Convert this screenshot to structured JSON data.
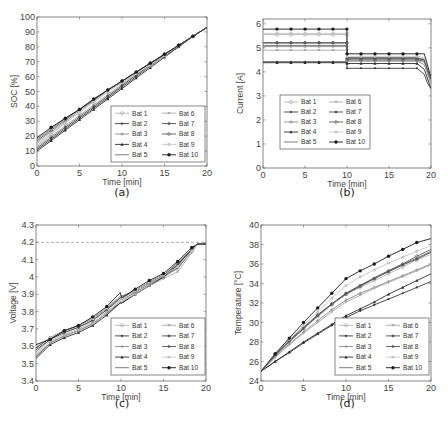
{
  "figure": {
    "panel_labels": [
      "(a)",
      "(b)",
      "(c)",
      "(d)"
    ],
    "legend_entries": [
      "Bat 1",
      "Bat 2",
      "Bat 3",
      "Bat 4",
      "Bat 5",
      "Bat 6",
      "Bat 7",
      "Bat 8",
      "Bat 9",
      "Bat 10"
    ],
    "series_style": [
      {
        "name": "Bat 1",
        "color": "#b5b5b5",
        "marker": "circle-open"
      },
      {
        "name": "Bat 2",
        "color": "#3a3a3a",
        "marker": "dot"
      },
      {
        "name": "Bat 3",
        "color": "#8a8a8a",
        "marker": "plus"
      },
      {
        "name": "Bat 4",
        "color": "#2e2e2e",
        "marker": "triangle"
      },
      {
        "name": "Bat 5",
        "color": "#6e6e6e",
        "marker": "none"
      },
      {
        "name": "Bat 6",
        "color": "#a8a8a8",
        "marker": "triangle-down"
      },
      {
        "name": "Bat 7",
        "color": "#4c4c4c",
        "marker": "star"
      },
      {
        "name": "Bat 8",
        "color": "#5a5a5a",
        "marker": "diamond"
      },
      {
        "name": "Bat 9",
        "color": "#c4c4c4",
        "marker": "square"
      },
      {
        "name": "Bat 10",
        "color": "#1a1a1a",
        "marker": "asterisk-dot"
      }
    ]
  },
  "chart_data": [
    {
      "panel": "(a)",
      "type": "line",
      "title": "",
      "xlabel": "Time [min]",
      "ylabel": "SOC [%]",
      "xlim": [
        0,
        20
      ],
      "ylim": [
        0,
        100
      ],
      "xticks": [
        0,
        5,
        10,
        15,
        20
      ],
      "yticks": [
        0,
        10,
        20,
        30,
        40,
        50,
        60,
        70,
        80,
        90,
        100
      ],
      "legend_position": "lower right",
      "x": [
        0,
        1.67,
        3.33,
        5,
        6.67,
        8.33,
        10,
        11.67,
        13.33,
        15,
        16.67,
        18.33,
        20
      ],
      "series": [
        {
          "name": "Bat 1",
          "values": [
            14,
            21,
            29,
            36,
            43,
            50,
            56,
            62,
            69,
            75,
            81,
            87,
            93
          ]
        },
        {
          "name": "Bat 2",
          "values": [
            11,
            18,
            25,
            32,
            39,
            46,
            53,
            60,
            67,
            74,
            80,
            87,
            93
          ]
        },
        {
          "name": "Bat 3",
          "values": [
            16,
            23,
            30,
            37,
            44,
            51,
            57,
            63,
            69,
            75,
            81,
            87,
            93
          ]
        },
        {
          "name": "Bat 4",
          "values": [
            10,
            17,
            24,
            31,
            38,
            45,
            52,
            59,
            66,
            73,
            80,
            87,
            93
          ]
        },
        {
          "name": "Bat 5",
          "values": [
            18,
            25,
            32,
            38,
            45,
            51,
            57,
            63,
            69,
            75,
            81,
            87,
            93
          ]
        },
        {
          "name": "Bat 6",
          "values": [
            13,
            20,
            27,
            34,
            41,
            48,
            55,
            61,
            67,
            74,
            80,
            87,
            93
          ]
        },
        {
          "name": "Bat 7",
          "values": [
            12,
            19,
            26,
            33,
            40,
            47,
            54,
            61,
            68,
            74,
            80,
            87,
            93
          ]
        },
        {
          "name": "Bat 8",
          "values": [
            17,
            24,
            31,
            38,
            44,
            51,
            57,
            63,
            69,
            75,
            81,
            87,
            93
          ]
        },
        {
          "name": "Bat 9",
          "values": [
            15,
            22,
            29,
            36,
            43,
            50,
            56,
            62,
            68,
            74,
            81,
            87,
            93
          ]
        },
        {
          "name": "Bat 10",
          "values": [
            19,
            26,
            32,
            38,
            45,
            51,
            57,
            63,
            69,
            75,
            81,
            87,
            93
          ]
        }
      ]
    },
    {
      "panel": "(b)",
      "type": "line",
      "title": "",
      "xlabel": "Time [min]",
      "ylabel": "Current [A]",
      "xlim": [
        0,
        20
      ],
      "ylim": [
        0,
        6.2
      ],
      "xticks": [
        0,
        5,
        10,
        15,
        20
      ],
      "yticks": [
        0,
        1,
        2,
        3,
        4,
        5,
        6
      ],
      "legend_position": "center left",
      "x": [
        0,
        1.67,
        3.33,
        5,
        6.67,
        8.33,
        9.99,
        10.01,
        11.67,
        13.33,
        15,
        16.67,
        18.33,
        19.2,
        19.5,
        19.8,
        20
      ],
      "series": [
        {
          "name": "Bat 1",
          "values": [
            5.55,
            5.55,
            5.55,
            5.55,
            5.55,
            5.55,
            5.55,
            4.55,
            4.55,
            4.55,
            4.55,
            4.55,
            4.55,
            4.55,
            4.1,
            3.7,
            3.5
          ]
        },
        {
          "name": "Bat 2",
          "values": [
            4.42,
            4.42,
            4.42,
            4.42,
            4.42,
            4.42,
            4.42,
            4.15,
            4.15,
            4.15,
            4.15,
            4.15,
            4.15,
            3.9,
            3.6,
            3.4,
            3.3
          ]
        },
        {
          "name": "Bat 3",
          "values": [
            5.05,
            5.05,
            5.05,
            5.05,
            5.05,
            5.05,
            5.05,
            4.45,
            4.45,
            4.45,
            4.45,
            4.45,
            4.45,
            4.3,
            4.0,
            3.7,
            3.5
          ]
        },
        {
          "name": "Bat 4",
          "values": [
            4.38,
            4.38,
            4.38,
            4.38,
            4.38,
            4.38,
            4.38,
            4.35,
            4.35,
            4.35,
            4.35,
            4.35,
            4.35,
            4.1,
            3.8,
            3.5,
            3.3
          ]
        },
        {
          "name": "Bat 5",
          "values": [
            5.1,
            5.1,
            5.1,
            5.1,
            5.1,
            5.1,
            5.1,
            4.6,
            4.6,
            4.6,
            4.6,
            4.6,
            4.6,
            4.5,
            4.2,
            3.9,
            3.6
          ]
        },
        {
          "name": "Bat 6",
          "values": [
            4.9,
            4.9,
            4.9,
            4.9,
            4.9,
            4.9,
            4.9,
            4.45,
            4.45,
            4.45,
            4.45,
            4.45,
            4.45,
            4.4,
            4.1,
            3.8,
            3.6
          ]
        },
        {
          "name": "Bat 7",
          "values": [
            5.2,
            5.2,
            5.2,
            5.2,
            5.2,
            5.2,
            5.2,
            4.55,
            4.55,
            4.55,
            4.55,
            4.55,
            4.55,
            4.5,
            4.2,
            3.9,
            3.7
          ]
        },
        {
          "name": "Bat 8",
          "values": [
            5.22,
            5.22,
            5.22,
            5.22,
            5.22,
            5.22,
            5.22,
            4.5,
            4.5,
            4.5,
            4.5,
            4.5,
            4.5,
            4.45,
            4.15,
            3.85,
            3.7
          ]
        },
        {
          "name": "Bat 9",
          "values": [
            5.6,
            5.6,
            5.6,
            5.6,
            5.6,
            5.6,
            5.6,
            4.65,
            4.65,
            4.65,
            4.65,
            4.65,
            4.65,
            4.6,
            4.3,
            4.0,
            3.8
          ]
        },
        {
          "name": "Bat 10",
          "values": [
            5.78,
            5.78,
            5.78,
            5.78,
            5.78,
            5.78,
            5.78,
            4.75,
            4.75,
            4.75,
            4.75,
            4.75,
            4.75,
            4.75,
            4.4,
            4.0,
            3.8
          ]
        }
      ]
    },
    {
      "panel": "(c)",
      "type": "line",
      "title": "",
      "xlabel": "Time [min]",
      "ylabel": "Voltage [V]",
      "xlim": [
        0,
        20
      ],
      "ylim": [
        3.4,
        4.3
      ],
      "xticks": [
        0,
        5,
        10,
        15,
        20
      ],
      "yticks": [
        3.4,
        3.5,
        3.6,
        3.7,
        3.8,
        3.9,
        4.0,
        4.1,
        4.2,
        4.3
      ],
      "ytick_labels": [
        "3.4",
        "3.5",
        "3.6",
        "3.7",
        "3.8",
        "3.9",
        "4",
        "4.1",
        "4.2",
        "4.3"
      ],
      "reference_line": {
        "y": 4.2,
        "style": "dashed",
        "label": "4.2 V cutoff"
      },
      "legend_position": "lower right",
      "x": [
        0,
        1.67,
        3.33,
        5,
        6.67,
        8.33,
        9.9,
        10.1,
        11.67,
        13.33,
        15,
        16.67,
        18.33,
        19,
        20
      ],
      "series": [
        {
          "name": "Bat 1",
          "values": [
            3.56,
            3.63,
            3.67,
            3.7,
            3.74,
            3.8,
            3.86,
            3.86,
            3.91,
            3.96,
            4.0,
            4.06,
            4.15,
            4.19,
            4.19
          ]
        },
        {
          "name": "Bat 2",
          "values": [
            3.54,
            3.62,
            3.66,
            3.69,
            3.73,
            3.79,
            3.85,
            3.85,
            3.9,
            3.95,
            4.0,
            4.07,
            4.16,
            4.19,
            4.19
          ]
        },
        {
          "name": "Bat 3",
          "values": [
            3.57,
            3.64,
            3.68,
            3.71,
            3.75,
            3.81,
            3.87,
            3.87,
            3.91,
            3.96,
            4.0,
            4.05,
            4.15,
            4.19,
            4.19
          ]
        },
        {
          "name": "Bat 4",
          "values": [
            3.53,
            3.61,
            3.65,
            3.68,
            3.72,
            3.78,
            3.85,
            3.85,
            3.9,
            3.95,
            4.0,
            4.07,
            4.16,
            4.19,
            4.19
          ]
        },
        {
          "name": "Bat 5",
          "values": [
            3.59,
            3.65,
            3.69,
            3.72,
            3.76,
            3.82,
            3.88,
            3.88,
            3.92,
            3.97,
            4.01,
            4.05,
            4.15,
            4.19,
            4.19
          ]
        },
        {
          "name": "Bat 6",
          "values": [
            3.55,
            3.62,
            3.66,
            3.69,
            3.73,
            3.79,
            3.86,
            3.86,
            3.9,
            3.95,
            3.99,
            4.03,
            4.14,
            4.19,
            4.19
          ]
        },
        {
          "name": "Bat 7",
          "values": [
            3.58,
            3.64,
            3.68,
            3.71,
            3.75,
            3.81,
            3.88,
            3.88,
            3.92,
            3.97,
            4.01,
            4.07,
            4.16,
            4.19,
            4.19
          ]
        },
        {
          "name": "Bat 8",
          "values": [
            3.59,
            3.65,
            3.69,
            3.72,
            3.76,
            3.82,
            3.89,
            3.89,
            3.92,
            3.97,
            4.01,
            4.08,
            4.16,
            4.19,
            4.19
          ]
        },
        {
          "name": "Bat 9",
          "values": [
            3.6,
            3.65,
            3.69,
            3.72,
            3.76,
            3.82,
            3.89,
            3.88,
            3.92,
            3.97,
            4.01,
            4.06,
            4.15,
            4.19,
            4.19
          ]
        },
        {
          "name": "Bat 10",
          "values": [
            3.61,
            3.64,
            3.69,
            3.72,
            3.77,
            3.83,
            3.91,
            3.88,
            3.93,
            3.98,
            4.02,
            4.09,
            4.17,
            4.19,
            4.19
          ]
        }
      ]
    },
    {
      "panel": "(d)",
      "type": "line",
      "title": "",
      "xlabel": "Time [min]",
      "ylabel": "Temperature [°C]",
      "xlim": [
        0,
        20
      ],
      "ylim": [
        24,
        40
      ],
      "xticks": [
        0,
        5,
        10,
        15,
        20
      ],
      "yticks": [
        24,
        26,
        28,
        30,
        32,
        34,
        36,
        38,
        40
      ],
      "legend_position": "lower right",
      "x": [
        0,
        1.67,
        3.33,
        5,
        6.67,
        8.33,
        10,
        11.67,
        13.33,
        15,
        16.67,
        18.33,
        20
      ],
      "series": [
        {
          "name": "Bat 1",
          "values": [
            25,
            26.6,
            28.0,
            29.3,
            30.6,
            31.8,
            32.9,
            33.6,
            34.3,
            35.0,
            35.7,
            36.4,
            37.0
          ]
        },
        {
          "name": "Bat 2",
          "values": [
            25,
            26.0,
            26.9,
            27.9,
            28.8,
            29.7,
            30.5,
            31.2,
            31.8,
            32.4,
            33.0,
            33.6,
            34.2
          ]
        },
        {
          "name": "Bat 3",
          "values": [
            25,
            26.5,
            27.8,
            29.0,
            30.2,
            31.3,
            32.3,
            33.0,
            33.6,
            34.2,
            34.8,
            35.4,
            36.0
          ]
        },
        {
          "name": "Bat 4",
          "values": [
            25,
            26.0,
            27.0,
            28.0,
            28.9,
            29.8,
            30.7,
            31.4,
            32.1,
            32.9,
            33.6,
            34.3,
            35.0
          ]
        },
        {
          "name": "Bat 5",
          "values": [
            25,
            26.6,
            28.0,
            29.4,
            30.7,
            31.9,
            33.0,
            33.8,
            34.6,
            35.3,
            36.0,
            36.6,
            37.3
          ]
        },
        {
          "name": "Bat 6",
          "values": [
            25,
            26.4,
            27.7,
            28.9,
            30.0,
            31.1,
            32.1,
            32.8,
            33.5,
            34.1,
            34.7,
            35.3,
            35.9
          ]
        },
        {
          "name": "Bat 7",
          "values": [
            25,
            26.7,
            28.1,
            29.4,
            30.7,
            31.9,
            33.0,
            33.8,
            34.5,
            35.2,
            35.9,
            36.5,
            37.2
          ]
        },
        {
          "name": "Bat 8",
          "values": [
            25,
            26.7,
            28.2,
            29.5,
            30.8,
            31.9,
            32.9,
            33.7,
            34.5,
            35.3,
            36.0,
            36.8,
            37.5
          ]
        },
        {
          "name": "Bat 9",
          "values": [
            25,
            26.8,
            28.3,
            29.7,
            31.1,
            32.5,
            33.8,
            34.7,
            35.4,
            36.1,
            36.7,
            37.3,
            37.9
          ]
        },
        {
          "name": "Bat 10",
          "values": [
            25,
            26.8,
            28.4,
            30.0,
            31.5,
            33.0,
            34.5,
            35.3,
            36.0,
            36.8,
            37.5,
            38.2,
            38.6
          ]
        }
      ]
    }
  ]
}
